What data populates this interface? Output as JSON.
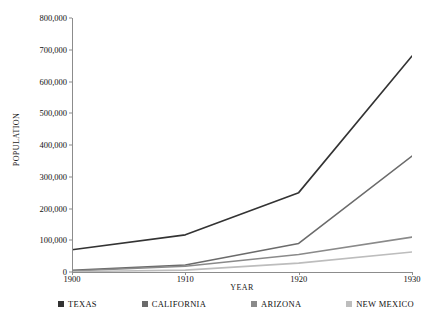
{
  "chart_data": {
    "type": "line",
    "title": "",
    "xlabel": "YEAR",
    "ylabel": "POPULATION",
    "x": [
      1900,
      1910,
      1920,
      1930
    ],
    "xticklabels": [
      "1900",
      "1910",
      "1920",
      "1930"
    ],
    "yticklabels": [
      "0",
      "100,000",
      "200,000",
      "300,000",
      "400,000",
      "500,000",
      "600,000",
      "700,000",
      "800,000"
    ],
    "yticks": [
      0,
      100000,
      200000,
      300000,
      400000,
      500000,
      600000,
      700000,
      800000
    ],
    "xlim": [
      1900,
      1930
    ],
    "ylim": [
      0,
      800000
    ],
    "grid": false,
    "legend_position": "bottom",
    "series": [
      {
        "name": "TEXAS",
        "values": [
          70000,
          117000,
          250000,
          680000
        ],
        "color": "#333333"
      },
      {
        "name": "CALIFORNIA",
        "values": [
          5000,
          22000,
          90000,
          365000
        ],
        "color": "#6b6b6b"
      },
      {
        "name": "ARIZONA",
        "values": [
          3000,
          18000,
          55000,
          110000
        ],
        "color": "#8a8a8a"
      },
      {
        "name": "NEW MEXICO",
        "values": [
          1000,
          6000,
          28000,
          63000
        ],
        "color": "#bdbdbd"
      }
    ]
  },
  "axis": {
    "ylabel": "POPULATION",
    "xlabel": "YEAR",
    "yticks": [
      {
        "label": "800,000",
        "value": 800000
      },
      {
        "label": "700,000",
        "value": 700000
      },
      {
        "label": "600,000",
        "value": 600000
      },
      {
        "label": "500,000",
        "value": 500000
      },
      {
        "label": "400,000",
        "value": 400000
      },
      {
        "label": "300,000",
        "value": 300000
      },
      {
        "label": "200,000",
        "value": 200000
      },
      {
        "label": "100,000",
        "value": 100000
      },
      {
        "label": "0",
        "value": 0
      }
    ],
    "xticks": [
      {
        "label": "1900",
        "value": 1900
      },
      {
        "label": "1910",
        "value": 1910
      },
      {
        "label": "1920",
        "value": 1920
      },
      {
        "label": "1930",
        "value": 1930
      }
    ]
  },
  "legend": {
    "items": [
      {
        "label": "TEXAS",
        "color": "#333333"
      },
      {
        "label": "CALIFORNIA",
        "color": "#6b6b6b"
      },
      {
        "label": "ARIZONA",
        "color": "#8a8a8a"
      },
      {
        "label": "NEW MEXICO",
        "color": "#bdbdbd"
      }
    ]
  }
}
